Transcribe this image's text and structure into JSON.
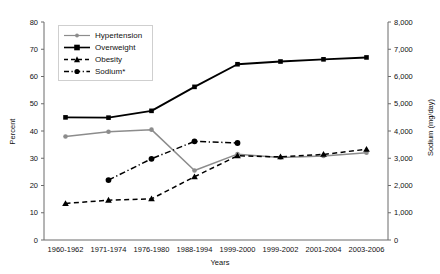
{
  "chart_data": {
    "type": "line",
    "title": "",
    "xlabel": "Years",
    "ylabel": "Percent",
    "y2label": "Sodium (mg/day)",
    "ylim": [
      0,
      80
    ],
    "y2lim": [
      0,
      8000
    ],
    "ytick_step": 10,
    "y2tick_step": 1000,
    "grid": false,
    "legend_position": "top-left-inside",
    "categories": [
      "1960-1962",
      "1971-1974",
      "1976-1980",
      "1988-1994",
      "1999-2000",
      "1999-2002",
      "2001-2004",
      "2003-2006"
    ],
    "yticks": [
      "0",
      "10",
      "20",
      "30",
      "40",
      "50",
      "60",
      "70",
      "80"
    ],
    "y2ticks": [
      "0",
      "1,000",
      "2,000",
      "3,000",
      "4,000",
      "5,000",
      "6,000",
      "7,000",
      "8,000"
    ],
    "series": [
      {
        "name": "Hypertension",
        "color": "#8c8c8c",
        "marker": "circle",
        "dash": "solid",
        "axis": "left",
        "values": [
          38.0,
          39.7,
          40.5,
          25.5,
          31.5,
          30.3,
          30.8,
          32.0
        ]
      },
      {
        "name": "Overweight",
        "color": "#000000",
        "marker": "square",
        "dash": "solid",
        "axis": "left",
        "values": [
          45.0,
          44.9,
          47.4,
          56.2,
          64.5,
          65.5,
          66.3,
          67.0
        ]
      },
      {
        "name": "Obesity",
        "color": "#000000",
        "marker": "triangle",
        "dash": "dashed",
        "axis": "left",
        "values": [
          13.4,
          14.6,
          15.1,
          23.2,
          30.9,
          30.5,
          31.4,
          33.3
        ]
      },
      {
        "name": "Sodium*",
        "color": "#000000",
        "marker": "circle",
        "dash": "dashdot",
        "axis": "right",
        "values": [
          null,
          2200,
          2980,
          3620,
          3560,
          null,
          null,
          null
        ]
      }
    ]
  },
  "legend": {
    "items": [
      {
        "label": "Hypertension"
      },
      {
        "label": "Overweight"
      },
      {
        "label": "Obesity"
      },
      {
        "label": "Sodium*"
      }
    ]
  }
}
